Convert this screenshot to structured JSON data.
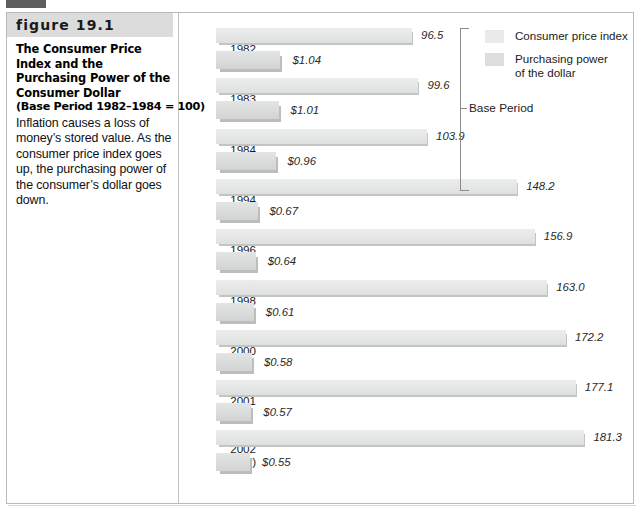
{
  "figure": {
    "number_label": "figure 19.1",
    "title_line1": "The Consumer Price Index and the",
    "title_line2": "Purchasing Power of the",
    "title_line3": "Consumer Dollar",
    "subtitle": "(Base Period 1982–1984 = 100)",
    "body": "Inflation causes a loss of money’s stored value. As the consumer price index goes up, the purchasing power of the consumer’s dollar goes down."
  },
  "legend": {
    "items": [
      {
        "label": "Consumer price index",
        "color": "#e9eaea"
      },
      {
        "label": "Purchasing power\nof the dollar",
        "color": "#dcdddd"
      }
    ]
  },
  "annotations": {
    "base_period_label": "Base Period"
  },
  "chart_data": {
    "type": "bar",
    "title": "The Consumer Price Index and the Purchasing Power of the Consumer Dollar",
    "subtitle": "(Base Period 1982–1984 = 100)",
    "orientation": "horizontal",
    "grid": false,
    "legend_position": "top-right",
    "xlabel": "",
    "ylabel": "",
    "categories": [
      "1982",
      "1983",
      "1984",
      "1994",
      "1996",
      "1998",
      "2000",
      "2001",
      "2002\n(Nov)"
    ],
    "series": [
      {
        "name": "Consumer price index",
        "values": [
          96.5,
          99.6,
          103.9,
          148.2,
          156.9,
          163.0,
          172.2,
          177.1,
          181.3
        ],
        "labels": [
          "96.5",
          "99.6",
          "103.9",
          "148.2",
          "156.9",
          "163.0",
          "172.2",
          "177.1",
          "181.3"
        ],
        "color": "#e9eaea"
      },
      {
        "name": "Purchasing power of the dollar",
        "values": [
          1.04,
          1.01,
          0.96,
          0.67,
          0.64,
          0.61,
          0.58,
          0.57,
          0.55
        ],
        "labels": [
          "$1.04",
          "$1.01",
          "$0.96",
          "$0.67",
          "$0.64",
          "$0.61",
          "$0.58",
          "$0.57",
          "$0.55"
        ],
        "color": "#dcdddd"
      }
    ],
    "annotation": {
      "text": "Base Period",
      "spans": [
        "1982",
        "1983",
        "1984"
      ]
    },
    "rows": [
      {
        "year": "1982",
        "cpi": 96.5,
        "cpi_label": "96.5",
        "dollar": 1.04,
        "dollar_label": "$1.04"
      },
      {
        "year": "1983",
        "cpi": 99.6,
        "cpi_label": "99.6",
        "dollar": 1.01,
        "dollar_label": "$1.01"
      },
      {
        "year": "1984",
        "cpi": 103.9,
        "cpi_label": "103.9",
        "dollar": 0.96,
        "dollar_label": "$0.96"
      },
      {
        "year": "1994",
        "cpi": 148.2,
        "cpi_label": "148.2",
        "dollar": 0.67,
        "dollar_label": "$0.67"
      },
      {
        "year": "1996",
        "cpi": 156.9,
        "cpi_label": "156.9",
        "dollar": 0.64,
        "dollar_label": "$0.64"
      },
      {
        "year": "1998",
        "cpi": 163.0,
        "cpi_label": "163.0",
        "dollar": 0.61,
        "dollar_label": "$0.61"
      },
      {
        "year": "2000",
        "cpi": 172.2,
        "cpi_label": "172.2",
        "dollar": 0.58,
        "dollar_label": "$0.58"
      },
      {
        "year": "2001",
        "cpi": 177.1,
        "cpi_label": "177.1",
        "dollar": 0.57,
        "dollar_label": "$0.57"
      },
      {
        "year": "2002 (Nov)",
        "year_line1": "2002",
        "year_line2": "(Nov)",
        "cpi": 181.3,
        "cpi_label": "181.3",
        "dollar": 0.55,
        "dollar_label": "$0.55"
      }
    ]
  }
}
